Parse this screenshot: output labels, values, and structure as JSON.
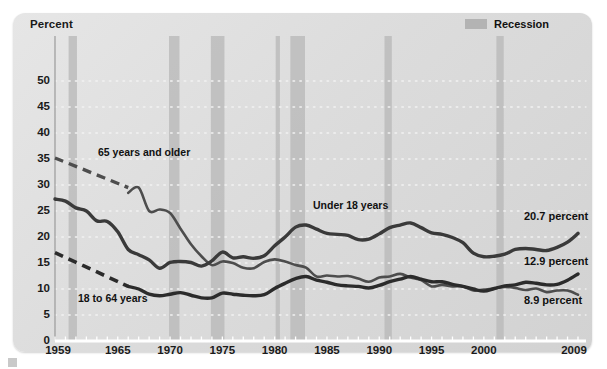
{
  "chart_data": {
    "type": "line",
    "title": "",
    "ylabel": "Percent",
    "xlabel": "",
    "ylim": [
      0,
      53
    ],
    "xlim": [
      1959,
      2009
    ],
    "yticks": [
      0,
      5,
      10,
      15,
      20,
      25,
      30,
      35,
      40,
      45,
      50
    ],
    "xticks": [
      1959,
      1965,
      1970,
      1975,
      1980,
      1985,
      1990,
      1995,
      2000,
      2009
    ],
    "grid": "dotted-horizontal",
    "legend": {
      "position": "top-right",
      "entries": [
        "Recession"
      ]
    },
    "series": [
      {
        "name": "65 years and older",
        "color": "#4d4d4d",
        "label_position": "upper-left",
        "end_value": 8.9,
        "end_label": "8.9 percent",
        "dashed_segment": {
          "x": [
            1959,
            1966
          ],
          "y": [
            35.2,
            29.5
          ]
        },
        "x": [
          1966,
          1967,
          1968,
          1969,
          1970,
          1971,
          1972,
          1973,
          1974,
          1975,
          1976,
          1977,
          1978,
          1979,
          1980,
          1981,
          1982,
          1983,
          1984,
          1985,
          1986,
          1987,
          1988,
          1989,
          1990,
          1991,
          1992,
          1993,
          1994,
          1995,
          1996,
          1997,
          1998,
          1999,
          2000,
          2001,
          2002,
          2003,
          2004,
          2005,
          2006,
          2007,
          2008,
          2009
        ],
        "y": [
          28.5,
          29.5,
          25.0,
          25.3,
          24.6,
          21.6,
          18.6,
          16.3,
          14.6,
          15.3,
          15.0,
          14.1,
          14.0,
          15.2,
          15.7,
          15.3,
          14.6,
          14.1,
          12.4,
          12.6,
          12.4,
          12.5,
          12.0,
          11.4,
          12.2,
          12.4,
          12.9,
          12.2,
          11.7,
          10.5,
          10.8,
          10.5,
          10.5,
          9.7,
          9.9,
          10.1,
          10.4,
          10.2,
          9.8,
          10.1,
          9.4,
          9.7,
          9.7,
          8.9
        ]
      },
      {
        "name": "Under 18 years",
        "color": "#3a3a3a",
        "label_position": "mid-right",
        "end_value": 20.7,
        "end_label": "20.7 percent",
        "x": [
          1959,
          1960,
          1961,
          1962,
          1963,
          1964,
          1965,
          1966,
          1967,
          1968,
          1969,
          1970,
          1971,
          1972,
          1973,
          1974,
          1975,
          1976,
          1977,
          1978,
          1979,
          1980,
          1981,
          1982,
          1983,
          1984,
          1985,
          1986,
          1987,
          1988,
          1989,
          1990,
          1991,
          1992,
          1993,
          1994,
          1995,
          1996,
          1997,
          1998,
          1999,
          2000,
          2001,
          2002,
          2003,
          2004,
          2005,
          2006,
          2007,
          2008,
          2009
        ],
        "y": [
          27.3,
          26.9,
          25.6,
          25.0,
          23.1,
          23.0,
          21.0,
          17.6,
          16.6,
          15.6,
          14.0,
          15.1,
          15.3,
          15.1,
          14.4,
          15.4,
          17.1,
          16.0,
          16.2,
          15.9,
          16.4,
          18.3,
          20.0,
          21.9,
          22.3,
          21.5,
          20.7,
          20.5,
          20.3,
          19.5,
          19.6,
          20.6,
          21.8,
          22.3,
          22.7,
          21.8,
          20.8,
          20.5,
          19.9,
          18.9,
          16.9,
          16.2,
          16.3,
          16.7,
          17.6,
          17.8,
          17.6,
          17.4,
          18.0,
          19.0,
          20.7
        ]
      },
      {
        "name": "18 to 64 years",
        "color": "#2b2b2b",
        "label_position": "lower-left",
        "end_value": 12.9,
        "end_label": "12.9 percent",
        "dashed_segment": {
          "x": [
            1959,
            1966
          ],
          "y": [
            17.0,
            10.5
          ]
        },
        "x": [
          1966,
          1967,
          1968,
          1969,
          1970,
          1971,
          1972,
          1973,
          1974,
          1975,
          1976,
          1977,
          1978,
          1979,
          1980,
          1981,
          1982,
          1983,
          1984,
          1985,
          1986,
          1987,
          1988,
          1989,
          1990,
          1991,
          1992,
          1993,
          1994,
          1995,
          1996,
          1997,
          1998,
          1999,
          2000,
          2001,
          2002,
          2003,
          2004,
          2005,
          2006,
          2007,
          2008,
          2009
        ],
        "y": [
          10.5,
          10.0,
          9.0,
          8.7,
          9.0,
          9.3,
          8.8,
          8.3,
          8.3,
          9.2,
          9.0,
          8.8,
          8.7,
          8.9,
          10.1,
          11.1,
          12.0,
          12.4,
          11.7,
          11.3,
          10.8,
          10.6,
          10.5,
          10.2,
          10.7,
          11.4,
          11.9,
          12.4,
          11.9,
          11.4,
          11.4,
          10.9,
          10.5,
          10.0,
          9.6,
          10.1,
          10.6,
          10.8,
          11.3,
          11.1,
          10.8,
          10.9,
          11.7,
          12.9
        ]
      }
    ],
    "recessions": [
      {
        "start": 1960.3,
        "end": 1961.1
      },
      {
        "start": 1969.9,
        "end": 1970.9
      },
      {
        "start": 1973.9,
        "end": 1975.2
      },
      {
        "start": 1980.1,
        "end": 1980.5
      },
      {
        "start": 1981.5,
        "end": 1982.9
      },
      {
        "start": 1990.5,
        "end": 1991.2
      },
      {
        "start": 2001.2,
        "end": 2001.9
      }
    ]
  },
  "axis": {
    "y_title": "Percent",
    "y_ticks": [
      "50",
      "45",
      "40",
      "35",
      "30",
      "25",
      "20",
      "15",
      "10",
      "5",
      "0"
    ],
    "x_ticks": [
      "1959",
      "1965",
      "1970",
      "1975",
      "1980",
      "1985",
      "1990",
      "1995",
      "2000",
      "2009"
    ]
  },
  "legend": {
    "recession_label": "Recession",
    "recession_color": "#b3b3b3"
  },
  "series_labels": {
    "older": "65 years and older",
    "under18": "Under 18 years",
    "adults": "18 to 64 years"
  },
  "end_labels": {
    "under18": "20.7 percent",
    "adults": "12.9 percent",
    "older": "8.9 percent"
  },
  "colors": {
    "panel_bg": "#dedede",
    "recession_band": "#b8b8b8",
    "line_dark": "#2b2b2b",
    "line_mid": "#3f3f3f",
    "gridline": "#f2f2f2"
  }
}
